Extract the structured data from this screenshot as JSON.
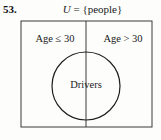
{
  "figure": {
    "problem_number": "53.",
    "title_prefix": "U",
    "title_rest": " = {people}",
    "title_full": "U = {people}",
    "universe_label": "U = {people}",
    "left_region_label": "Age ≤ 30",
    "right_region_label": "Age > 30",
    "circle_label": "Drivers",
    "colors": {
      "background": "#fdfdfc",
      "stroke": "#3a3a3a",
      "circle_stroke": "#1f1f1f",
      "text": "#1a1a1a"
    },
    "geometry": {
      "rect_x": 21,
      "rect_y": 21,
      "rect_width": 131,
      "rect_height": 106,
      "divider_x": 86,
      "circle_cx": 86,
      "circle_cy": 86,
      "circle_r": 34
    }
  }
}
